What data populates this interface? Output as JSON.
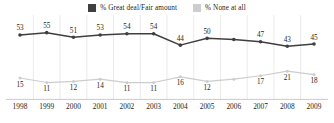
{
  "legend": {
    "entries": [
      {
        "label": "% Great deal/Fair amount",
        "color": "#3f3f42",
        "swatch_name": "legend-swatch-great-deal"
      },
      {
        "label": "% None at all",
        "color": "#cdcdcd",
        "swatch_name": "legend-swatch-none-at-all"
      }
    ]
  },
  "chart_data": {
    "type": "line",
    "title": "",
    "xlabel": "",
    "ylabel": "",
    "ylim": [
      0,
      60
    ],
    "grid": "vertical",
    "legend_position": "top-center",
    "categories": [
      "1998",
      "1999",
      "2000",
      "2001",
      "2002",
      "2003",
      "2004",
      "2005",
      "2006",
      "2007",
      "2008",
      "2009"
    ],
    "series": [
      {
        "name": "% Great deal/Fair amount",
        "color": "#3f3f42",
        "values": [
          53,
          55,
          51,
          53,
          54,
          54,
          44,
          50,
          49,
          47,
          43,
          45
        ],
        "labels": [
          "53",
          "55",
          "51",
          "53",
          "54",
          "54",
          "44",
          "50",
          "",
          "47",
          "43",
          "45"
        ]
      },
      {
        "name": "% None at all",
        "color": "#cdcdcd",
        "values": [
          15,
          11,
          12,
          14,
          11,
          11,
          16,
          12,
          14,
          17,
          21,
          18
        ],
        "labels": [
          "15",
          "11",
          "12",
          "14",
          "11",
          "11",
          "16",
          "12",
          "",
          "17",
          "21",
          "18"
        ]
      }
    ]
  }
}
